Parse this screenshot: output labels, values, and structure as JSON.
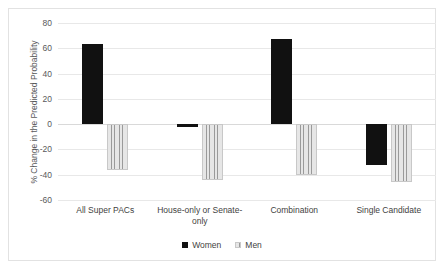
{
  "chart_data": {
    "type": "bar",
    "title": "",
    "xlabel": "",
    "ylabel": "% Change in the Predicted Probability",
    "ylim": [
      -60,
      80
    ],
    "yticks": [
      80,
      60,
      40,
      20,
      0,
      -20,
      -40,
      -60
    ],
    "ytick_labels": [
      "80",
      "60",
      "40",
      "20",
      "0",
      "-20",
      "-40",
      "-60"
    ],
    "grid": true,
    "legend_position": "bottom",
    "categories": [
      "All Super PACs",
      "House-only or Senate-only",
      "Combination",
      "Single Candidate"
    ],
    "series": [
      {
        "name": "Women",
        "color": "#111111",
        "values": [
          63,
          -2,
          67,
          -32
        ]
      },
      {
        "name": "Men",
        "color": "#d8d8d8",
        "values": [
          -36,
          -44,
          -40,
          -46
        ]
      }
    ]
  },
  "legend": {
    "items": [
      {
        "label": "Women",
        "swatch": "women-swatch-icon"
      },
      {
        "label": "Men",
        "swatch": "men-swatch-icon"
      }
    ]
  }
}
